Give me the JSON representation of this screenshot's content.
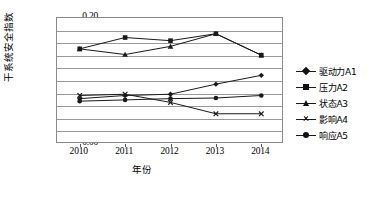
{
  "chart_data": {
    "type": "line",
    "title": "",
    "xlabel": "年份",
    "ylabel": "干系统安全指数",
    "categories": [
      "2010",
      "2011",
      "2012",
      "2013",
      "2014"
    ],
    "ylim": [
      0.0,
      0.2
    ],
    "ytick_step": 0.02,
    "yticks": [
      "0.20",
      "0.18",
      "0.16",
      "0.14",
      "0.12",
      "0.10",
      "0.08",
      "0.06",
      "0.04",
      "0.02",
      "0.00"
    ],
    "grid": true,
    "legend_position": "right",
    "series": [
      {
        "name": "驱动力A1",
        "marker": "diamond",
        "values": [
          0.072,
          0.077,
          0.079,
          0.095,
          0.109
        ]
      },
      {
        "name": "压力A2",
        "marker": "square",
        "values": [
          0.151,
          0.169,
          0.164,
          0.175,
          0.141
        ]
      },
      {
        "name": "状态A3",
        "marker": "triangle",
        "values": [
          0.151,
          0.142,
          0.155,
          0.175,
          0.141
        ]
      },
      {
        "name": "影响A4",
        "marker": "cross",
        "values": [
          0.077,
          0.079,
          0.066,
          0.048,
          0.048
        ]
      },
      {
        "name": "响应A5",
        "marker": "circle",
        "values": [
          0.068,
          0.07,
          0.072,
          0.073,
          0.077
        ]
      }
    ]
  },
  "legend": {
    "items": [
      {
        "label": "驱动力A1",
        "marker": "diamond"
      },
      {
        "label": "压力A2",
        "marker": "square"
      },
      {
        "label": "状态A3",
        "marker": "triangle"
      },
      {
        "label": "影响A4",
        "marker": "cross"
      },
      {
        "label": "响应A5",
        "marker": "circle"
      }
    ]
  },
  "colors": {
    "line": "#1a1a1a",
    "grid": "#9a9a9a",
    "frame": "#8a8a8a",
    "text": "#000000"
  }
}
